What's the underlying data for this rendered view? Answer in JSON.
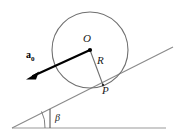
{
  "figure": {
    "labels": {
      "center": "O",
      "radius": "R",
      "contact_point": "P",
      "incline_angle": "β",
      "acceleration_symbol": "a",
      "acceleration_subscript": "0"
    },
    "colors": {
      "circle_stroke": "#6f6f6f",
      "radius_stroke": "#6f6f6f",
      "incline_stroke": "#8a8a8a",
      "baseline_stroke": "#9a9a9a",
      "vector_stroke": "#000000",
      "center_dot": "#000000",
      "text": "#1a1a1a",
      "background": "#ffffff"
    },
    "geometry": {
      "circle_center_x": 90,
      "circle_center_y": 50,
      "circle_radius": 38,
      "contact_point_x": 103,
      "contact_point_y": 85,
      "vector_tip_x": 27,
      "vector_tip_y": 79,
      "incline_left_x": 12,
      "incline_left_y": 128,
      "incline_right_x": 173,
      "incline_right_y": 47,
      "baseline_left_x": 12,
      "baseline_left_y": 128,
      "baseline_right_x": 166,
      "baseline_right_y": 128,
      "angle_arc_x": 50,
      "angle_arc_y": 128,
      "angle_arc_radius": 33
    }
  }
}
